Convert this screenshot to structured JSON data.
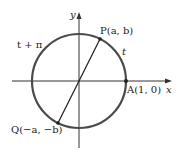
{
  "diagram": {
    "type": "unit-circle",
    "colors": {
      "circle": "#4a4a4a",
      "axes": "#333333",
      "segment": "#222222",
      "text": "#222222"
    },
    "axes": {
      "x_label": "x",
      "y_label": "y"
    },
    "points": {
      "P": "P(a, b)",
      "Q": "Q(−a, −b)",
      "A": "A(1, 0)"
    },
    "arcs": {
      "t": "t",
      "t_plus_pi": "t + π"
    }
  }
}
